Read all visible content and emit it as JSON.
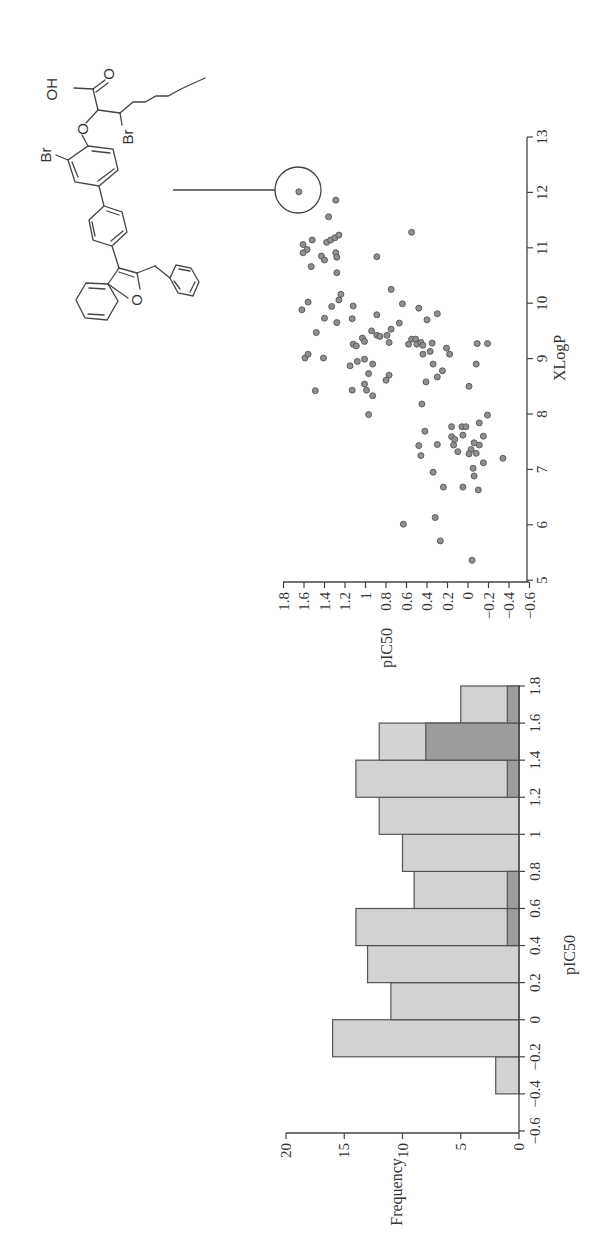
{
  "chart_data": [
    {
      "type": "bar",
      "title": "",
      "xlabel": "pIC50",
      "ylabel": "Frequency",
      "orientation": "figure rotated 90 degrees",
      "categories": [
        "-0.4 to -0.2",
        "-0.2 to 0",
        "0 to 0.2",
        "0.2 to 0.4",
        "0.4 to 0.6",
        "0.6 to 0.8",
        "0.8 to 1",
        "1 to 1.2",
        "1.2 to 1.4",
        "1.4 to 1.6",
        "1.6 to 1.8"
      ],
      "bin_edges": [
        -0.4,
        -0.2,
        0,
        0.2,
        0.4,
        0.6,
        0.8,
        1.0,
        1.2,
        1.4,
        1.6,
        1.8
      ],
      "series": [
        {
          "name": "All compounds",
          "color": "#d2d2d2",
          "values": [
            2,
            16,
            11,
            13,
            14,
            9,
            10,
            12,
            14,
            12,
            5
          ]
        },
        {
          "name": "Highlighted subset",
          "color": "#9c9c9c",
          "values": [
            0,
            0,
            0,
            0,
            1,
            1,
            0,
            0,
            1,
            8,
            1
          ]
        }
      ],
      "xlim": [
        -0.6,
        1.8
      ],
      "ylim": [
        0,
        20
      ],
      "x_ticks": [
        "-0.6",
        "-0.4",
        "-0.2",
        "0",
        "0.2",
        "0.4",
        "0.6",
        "0.8",
        "1",
        "1.2",
        "1.4",
        "1.6",
        "1.8"
      ],
      "y_ticks": [
        "0",
        "5",
        "10",
        "15",
        "20"
      ],
      "grid": false,
      "legend": "none"
    },
    {
      "type": "scatter",
      "title": "",
      "xlabel": "pIC50",
      "ylabel": "XLogP",
      "xlim": [
        -0.6,
        1.8
      ],
      "ylim": [
        5,
        13
      ],
      "x_ticks": [
        "-0.6",
        "-0.4",
        "-0.2",
        "0",
        "0.2",
        "0.4",
        "0.6",
        "0.8",
        "1",
        "1.2",
        "1.4",
        "1.6",
        "1.8"
      ],
      "y_ticks": [
        "5",
        "6",
        "7",
        "8",
        "9",
        "10",
        "11",
        "12",
        "13"
      ],
      "grid": false,
      "legend": "none",
      "highlighted_point": {
        "pIC50": 1.65,
        "XLogP": 12.0,
        "annotation": "circled, linked to structure"
      },
      "points": [
        [
          1.65,
          12.01
        ],
        [
          1.29,
          11.86
        ],
        [
          1.36,
          11.56
        ],
        [
          0.55,
          11.28
        ],
        [
          1.52,
          11.14
        ],
        [
          1.61,
          11.06
        ],
        [
          1.57,
          10.97
        ],
        [
          1.61,
          10.91
        ],
        [
          1.38,
          11.1
        ],
        [
          1.34,
          11.14
        ],
        [
          1.3,
          11.18
        ],
        [
          1.26,
          11.23
        ],
        [
          1.29,
          10.91
        ],
        [
          1.28,
          10.83
        ],
        [
          1.43,
          10.85
        ],
        [
          1.4,
          10.78
        ],
        [
          0.89,
          10.84
        ],
        [
          1.53,
          10.66
        ],
        [
          1.28,
          10.55
        ],
        [
          1.62,
          9.88
        ],
        [
          1.56,
          10.02
        ],
        [
          1.4,
          9.73
        ],
        [
          1.48,
          9.47
        ],
        [
          1.33,
          9.94
        ],
        [
          1.26,
          10.06
        ],
        [
          1.24,
          10.16
        ],
        [
          1.12,
          9.95
        ],
        [
          1.13,
          9.72
        ],
        [
          1.28,
          9.65
        ],
        [
          0.89,
          9.79
        ],
        [
          0.75,
          10.25
        ],
        [
          0.64,
          9.99
        ],
        [
          0.48,
          9.91
        ],
        [
          0.4,
          9.7
        ],
        [
          0.3,
          9.81
        ],
        [
          0.67,
          9.64
        ],
        [
          0.94,
          9.5
        ],
        [
          0.89,
          9.42
        ],
        [
          0.86,
          9.4
        ],
        [
          0.79,
          9.42
        ],
        [
          0.75,
          9.53
        ],
        [
          0.77,
          9.29
        ],
        [
          1.03,
          9.37
        ],
        [
          1.01,
          9.31
        ],
        [
          1.12,
          9.26
        ],
        [
          1.09,
          9.23
        ],
        [
          1.59,
          9.01
        ],
        [
          1.56,
          9.08
        ],
        [
          1.41,
          9.01
        ],
        [
          1.15,
          8.87
        ],
        [
          1.08,
          8.95
        ],
        [
          1.01,
          8.99
        ],
        [
          0.93,
          8.9
        ],
        [
          0.97,
          8.73
        ],
        [
          1.49,
          8.42
        ],
        [
          1.13,
          8.43
        ],
        [
          1.01,
          8.54
        ],
        [
          0.99,
          8.43
        ],
        [
          0.93,
          8.33
        ],
        [
          0.8,
          8.61
        ],
        [
          0.77,
          8.7
        ],
        [
          0.97,
          7.99
        ],
        [
          0.58,
          9.26
        ],
        [
          0.55,
          9.35
        ],
        [
          0.51,
          9.35
        ],
        [
          0.5,
          9.26
        ],
        [
          0.46,
          9.29
        ],
        [
          0.44,
          9.24
        ],
        [
          0.44,
          9.08
        ],
        [
          0.37,
          9.13
        ],
        [
          0.35,
          9.28
        ],
        [
          0.34,
          8.9
        ],
        [
          0.25,
          8.78
        ],
        [
          0.3,
          8.67
        ],
        [
          0.41,
          8.58
        ],
        [
          0.21,
          9.19
        ],
        [
          0.18,
          9.08
        ],
        [
          -0.09,
          9.27
        ],
        [
          -0.19,
          9.27
        ],
        [
          -0.08,
          8.9
        ],
        [
          -0.01,
          8.5
        ],
        [
          0.45,
          8.18
        ],
        [
          -0.19,
          7.98
        ],
        [
          -0.11,
          7.84
        ],
        [
          0.16,
          7.77
        ],
        [
          0.06,
          7.77
        ],
        [
          0.02,
          7.77
        ],
        [
          0.42,
          7.69
        ],
        [
          0.16,
          7.59
        ],
        [
          0.13,
          7.54
        ],
        [
          0.05,
          7.62
        ],
        [
          -0.15,
          7.6
        ],
        [
          0.48,
          7.43
        ],
        [
          0.3,
          7.45
        ],
        [
          0.46,
          7.25
        ],
        [
          0.14,
          7.44
        ],
        [
          0.1,
          7.32
        ],
        [
          -0.06,
          7.48
        ],
        [
          -0.11,
          7.44
        ],
        [
          -0.03,
          7.36
        ],
        [
          -0.01,
          7.28
        ],
        [
          -0.08,
          7.29
        ],
        [
          -0.15,
          7.12
        ],
        [
          -0.34,
          7.2
        ],
        [
          0.34,
          6.95
        ],
        [
          -0.05,
          7.02
        ],
        [
          -0.06,
          6.88
        ],
        [
          0.24,
          6.68
        ],
        [
          0.05,
          6.68
        ],
        [
          -0.1,
          6.63
        ],
        [
          0.63,
          6.01
        ],
        [
          0.32,
          6.13
        ],
        [
          0.27,
          5.71
        ],
        [
          -0.04,
          5.36
        ]
      ]
    }
  ],
  "histogram": {
    "x_label": "pIC50",
    "y_label": "Frequency",
    "x_ticks": [
      "1.8",
      "1.6",
      "1.4",
      "1.2",
      "1",
      "0.8",
      "0.6",
      "0.4",
      "0.2",
      "0",
      "−0.2",
      "−0.4",
      "−0.6"
    ],
    "y_ticks": [
      "20",
      "15",
      "10",
      "5",
      "0"
    ]
  },
  "scatter": {
    "x_label": "pIC50",
    "y_label": "XLogP",
    "x_ticks": [
      "1.8",
      "1.6",
      "1.4",
      "1.2",
      "1",
      "0.8",
      "0.6",
      "0.4",
      "0.2",
      "0",
      "−0.2",
      "−0.4",
      "−0.6"
    ],
    "y_ticks": [
      "13",
      "12",
      "11",
      "10",
      "9",
      "8",
      "7",
      "6",
      "5"
    ]
  },
  "structure": {
    "atoms": {
      "oh": "OH",
      "o_carbonyl": "O",
      "o_ring": "O",
      "br_1": "Br",
      "br_2": "Br",
      "o_furan": "O"
    }
  },
  "colors": {
    "bar_light": "#d2d2d2",
    "bar_dark": "#9c9c9c",
    "point": "#8f8f8f",
    "axis": "#444444"
  }
}
